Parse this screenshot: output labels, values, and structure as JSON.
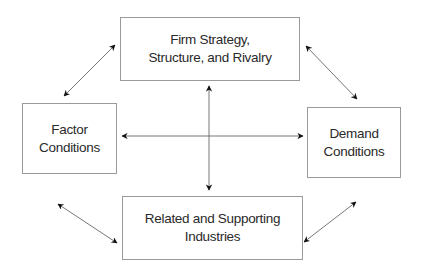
{
  "diagram": {
    "nodes": {
      "top": {
        "line1": "Firm Strategy,",
        "line2": "Structure, and Rivalry"
      },
      "left": {
        "line1": "Factor",
        "line2": "Conditions"
      },
      "right": {
        "line1": "Demand",
        "line2": "Conditions"
      },
      "bottom": {
        "line1": "Related and Supporting",
        "line2": "Industries"
      }
    },
    "edges": [
      {
        "from": "left",
        "to": "top",
        "type": "bidirectional"
      },
      {
        "from": "top",
        "to": "right",
        "type": "bidirectional"
      },
      {
        "from": "left",
        "to": "bottom",
        "type": "bidirectional"
      },
      {
        "from": "right",
        "to": "bottom",
        "type": "bidirectional"
      },
      {
        "from": "left",
        "to": "right",
        "type": "bidirectional"
      },
      {
        "from": "top",
        "to": "bottom",
        "type": "bidirectional"
      }
    ],
    "colors": {
      "box_border": "#9a9a9a",
      "arrow": "#555555",
      "arrowhead": "#111111",
      "text": "#2a2a2a"
    }
  }
}
